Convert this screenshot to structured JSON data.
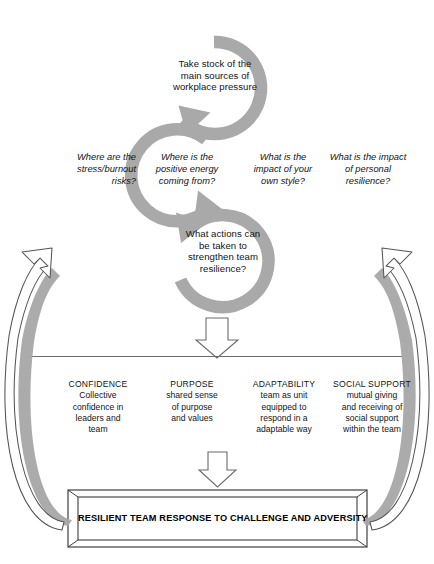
{
  "diagram": {
    "title_hidden": "",
    "colors": {
      "cycle_gray": "#a9a9a9",
      "shadow_gray": "#a6a6a6",
      "outline": "#4d4d4d",
      "text": "#141414",
      "background": "#ffffff"
    },
    "cycle": {
      "steps": [
        {
          "id": "step-1",
          "text": "Take stock of the\nmain sources of\nworkplace pressure"
        },
        {
          "id": "step-2",
          "text": "What actions can\nbe taken to\nstrengthen team\nresilience?"
        }
      ],
      "questions": [
        {
          "id": "q-1",
          "text": "Where are the\nstress/burnout\nrisks?"
        },
        {
          "id": "q-2",
          "text": "Where is the\npositive energy\ncoming from?"
        },
        {
          "id": "q-3",
          "text": "What is the\nimpact of your\nown style?"
        },
        {
          "id": "q-4",
          "text": "What is the impact\nof personal\nresilience?"
        }
      ]
    },
    "pillars": [
      {
        "head": "CONFIDENCE",
        "body": "Collective\nconfidence in\nleaders and\nteam"
      },
      {
        "head": "PURPOSE",
        "body": "shared sense\nof purpose\nand values"
      },
      {
        "head": "ADAPTABILITY",
        "body": "team as unit\nequipped to\nrespond in a\nadaptable way"
      },
      {
        "head": "SOCIAL SUPPORT",
        "body": "mutual giving\nand receiving of\nsocial support\nwithin the team"
      }
    ],
    "result": {
      "label": "RESILIENT TEAM RESPONSE TO CHALLENGE AND ADVERSITY"
    },
    "arrows": {
      "down_1": "down-block-arrow",
      "down_2": "down-block-arrow",
      "feedback_left": "curved-feedback-arrow-up",
      "feedback_right": "curved-feedback-arrow-up"
    }
  }
}
